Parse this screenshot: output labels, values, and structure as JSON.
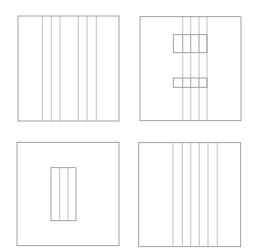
{
  "canvas": {
    "width": 268,
    "height": 249,
    "background": "#ffffff",
    "line_color": "#8a8a8a"
  },
  "panels": [
    {
      "name": "top-left",
      "frame": {
        "x": 18,
        "y": 16,
        "w": 101,
        "h": 105
      },
      "vertical_lines_x": [
        42.3,
        51.3,
        60,
        78.3,
        87,
        96.3
      ]
    },
    {
      "name": "top-right",
      "frame": {
        "x": 140,
        "y": 16.7,
        "w": 101,
        "h": 104
      },
      "vertical_lines_x": [
        182.7,
        190.7,
        199,
        207
      ],
      "notches": [
        {
          "x": 173.3,
          "y": 34.7,
          "w": 33.7,
          "h": 18
        },
        {
          "x": 173.3,
          "y": 78,
          "w": 33.7,
          "h": 9.3
        }
      ]
    },
    {
      "name": "bottom-left",
      "frame": {
        "x": 17,
        "y": 142.3,
        "w": 102,
        "h": 103.4
      },
      "inner_rect": {
        "x": 51,
        "y": 167.7,
        "w": 25,
        "h": 53
      },
      "inner_lines_x": [
        59.7,
        68
      ]
    },
    {
      "name": "bottom-right",
      "frame": {
        "x": 138.7,
        "y": 142.7,
        "w": 102,
        "h": 104
      },
      "vertical_lines_x": [
        173,
        182.3,
        190.7,
        199.3,
        208,
        217.3
      ]
    }
  ]
}
